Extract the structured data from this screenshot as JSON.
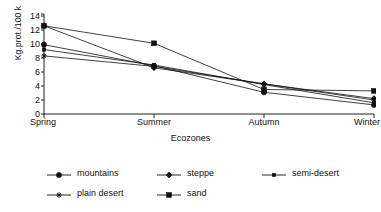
{
  "chart_data": {
    "type": "line",
    "title": "",
    "xlabel": "Ecozones",
    "ylabel": "Kg.prot./100 k",
    "categories": [
      "Spring",
      "Summer",
      "Autumn",
      "Winter"
    ],
    "ylim": [
      0,
      14
    ],
    "ytick_labels": [
      "0",
      "2",
      "4",
      "6",
      "8",
      "10",
      "12",
      "14"
    ],
    "ytick_values": [
      0,
      2,
      4,
      6,
      8,
      10,
      12,
      14
    ],
    "grid": false,
    "legend_position": "bottom",
    "series": [
      {
        "name": "mountains",
        "marker": "circle",
        "color": "#111111",
        "values": [
          9.9,
          6.9,
          3.1,
          1.3
        ]
      },
      {
        "name": "steppe",
        "marker": "diamond",
        "color": "#111111",
        "values": [
          12.6,
          6.6,
          4.3,
          2.2
        ]
      },
      {
        "name": "semi-desert",
        "marker": "small-square",
        "color": "#111111",
        "values": [
          9.2,
          7.0,
          4.2,
          1.6
        ]
      },
      {
        "name": "plain desert",
        "marker": "asterisk",
        "color": "#111111",
        "values": [
          8.3,
          6.8,
          4.3,
          2.0
        ]
      },
      {
        "name": "sand",
        "marker": "square",
        "color": "#111111",
        "values": [
          12.6,
          10.1,
          3.5,
          3.3
        ]
      }
    ]
  },
  "axis": {
    "y_title": "Kg.prot./100 k",
    "x_title": "Ecozones"
  }
}
